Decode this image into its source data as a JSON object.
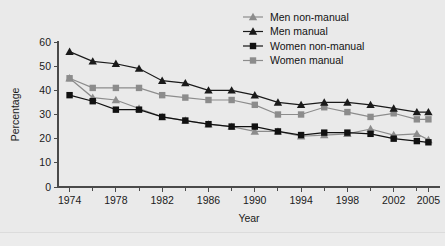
{
  "chart_data": {
    "type": "line",
    "title": "",
    "xlabel": "Year",
    "ylabel": "Percentage",
    "xlim": [
      1973,
      2006
    ],
    "ylim": [
      0,
      60
    ],
    "ytick_labels": [
      "0",
      "10",
      "20",
      "30",
      "40",
      "50",
      "60"
    ],
    "ytick_values": [
      0,
      10,
      20,
      30,
      40,
      50,
      60
    ],
    "xtick_labels": [
      "1974",
      "1978",
      "1982",
      "1986",
      "1990",
      "1994",
      "1998",
      "2002",
      "2005"
    ],
    "xtick_values": [
      1974,
      1978,
      1982,
      1986,
      1990,
      1994,
      1998,
      2002,
      2005
    ],
    "x": [
      1974,
      1976,
      1978,
      1980,
      1982,
      1984,
      1986,
      1988,
      1990,
      1992,
      1994,
      1996,
      1998,
      2000,
      2002,
      2004,
      2005
    ],
    "grid": false,
    "legend_position": "top-right",
    "series": [
      {
        "name": "Men non-manual",
        "color": "#8c8c8c",
        "marker": "triangle",
        "values": [
          45,
          37,
          36,
          32.5,
          29,
          27.5,
          26,
          25,
          23,
          23,
          21,
          21.5,
          22,
          24,
          21.5,
          22,
          19.5
        ]
      },
      {
        "name": "Men manual",
        "color": "#1a1a1a",
        "marker": "triangle",
        "values": [
          56,
          52,
          51,
          49,
          44,
          43,
          40,
          40,
          38,
          35,
          34,
          35,
          35,
          34,
          32.5,
          31,
          31
        ]
      },
      {
        "name": "Women non-manual",
        "color": "#111111",
        "marker": "square",
        "values": [
          38,
          35.5,
          32,
          32,
          29,
          27.5,
          26,
          25,
          25,
          23,
          21.5,
          22.5,
          22.5,
          22,
          20,
          19,
          18.5
        ]
      },
      {
        "name": "Women manual",
        "color": "#8c8c8c",
        "marker": "square",
        "values": [
          45,
          41,
          41,
          41,
          38,
          37,
          36,
          36,
          34,
          30,
          30,
          33,
          31,
          29,
          30.5,
          28,
          28
        ]
      }
    ]
  },
  "legend": {
    "items": [
      {
        "label": "Men non-manual"
      },
      {
        "label": "Men manual"
      },
      {
        "label": "Women non-manual"
      },
      {
        "label": "Women manual"
      }
    ]
  },
  "axes": {
    "y_title": "Percentage",
    "x_title": "Year"
  }
}
